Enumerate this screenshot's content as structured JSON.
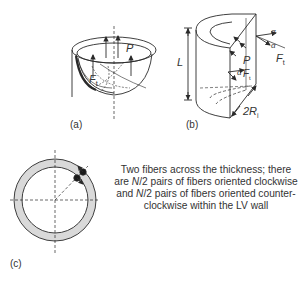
{
  "panels": {
    "a": {
      "label": "(a)",
      "symbols": {
        "pressure": "P",
        "force": "F",
        "force_sub": "t"
      }
    },
    "b": {
      "label": "(b)",
      "symbols": {
        "length": "L",
        "pressure": "P",
        "force": "F",
        "force_sub": "t",
        "angle": "α",
        "radius_prefix": "2R",
        "radius_sub": "i"
      }
    },
    "c": {
      "label": "(c)",
      "caption_parts": {
        "line1": "Two fibers across the thickness; there",
        "line2_pre": "are ",
        "n_symbol": "N",
        "line2_post": "/2 pairs of fibers oriented clockwise",
        "line3_pre": "and ",
        "line3_post": "/2 pairs of fibers oriented counter-",
        "line4": "clockwise within the LV wall"
      }
    }
  },
  "colors": {
    "line": "#2a2a2a",
    "wall_fill": "#d9d9d9",
    "background": "#ffffff"
  }
}
